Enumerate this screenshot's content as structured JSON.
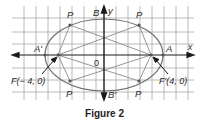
{
  "figure": {
    "caption": "Figure 2",
    "axes": {
      "x_label": "x",
      "y_label": "y",
      "origin_label": "0"
    },
    "vertices": {
      "A": "A",
      "A_prime": "A'",
      "B": "B",
      "B_prime": "B'"
    },
    "foci": {
      "F": "F(− 4, 0)",
      "F_prime": "F'(4, 0)"
    },
    "points": {
      "P1": "P",
      "P2": "P",
      "P3": "P",
      "P4": "P"
    }
  },
  "colors": {
    "grid": "#9a9a9a",
    "ellipse": "#6e6e6e",
    "chord": "#8a8a8a",
    "axis": "#1a1a1a",
    "text": "#2a2a2a"
  }
}
